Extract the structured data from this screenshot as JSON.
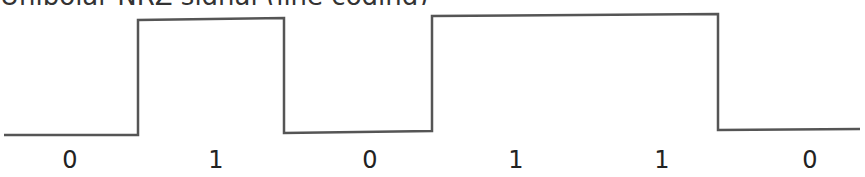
{
  "title": "Unipolar NRZ signal (line coding)",
  "signal": {
    "bits": [
      "0",
      "1",
      "0",
      "1",
      "1",
      "0"
    ],
    "stroke_color": "#555555",
    "points": [
      [
        4,
        135
      ],
      [
        138,
        135
      ],
      [
        138,
        20
      ],
      [
        284,
        18
      ],
      [
        284,
        133
      ],
      [
        432,
        131
      ],
      [
        432,
        16
      ],
      [
        718,
        14
      ],
      [
        718,
        130
      ],
      [
        860,
        129
      ]
    ]
  },
  "labels": [
    {
      "text": "0",
      "x": 70
    },
    {
      "text": "1",
      "x": 216
    },
    {
      "text": "0",
      "x": 370
    },
    {
      "text": "1",
      "x": 516
    },
    {
      "text": "1",
      "x": 662
    },
    {
      "text": "0",
      "x": 810
    }
  ]
}
